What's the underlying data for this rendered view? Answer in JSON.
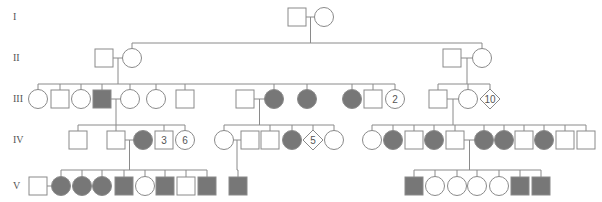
{
  "diagram": {
    "type": "pedigree",
    "colors": {
      "line": "#8a8a8a",
      "affected": "#777777",
      "unaffected": "#ffffff"
    },
    "generations": [
      {
        "label": "I",
        "y": 17
      },
      {
        "label": "II",
        "y": 58
      },
      {
        "label": "III",
        "y": 99
      },
      {
        "label": "IV",
        "y": 140
      },
      {
        "label": "V",
        "y": 186
      }
    ],
    "individuals": [
      {
        "id": "I-1",
        "gen": "I",
        "shape": "square",
        "x": 297,
        "affected": false
      },
      {
        "id": "I-2",
        "gen": "I",
        "shape": "circle",
        "x": 324,
        "affected": false
      },
      {
        "id": "II-1",
        "gen": "II",
        "shape": "square",
        "x": 104,
        "affected": false
      },
      {
        "id": "II-2",
        "gen": "II",
        "shape": "circle",
        "x": 132,
        "affected": false
      },
      {
        "id": "II-3",
        "gen": "II",
        "shape": "square",
        "x": 452,
        "affected": false
      },
      {
        "id": "II-4",
        "gen": "II",
        "shape": "circle",
        "x": 482,
        "affected": false
      },
      {
        "id": "III-1",
        "gen": "III",
        "shape": "circle",
        "x": 38,
        "affected": false
      },
      {
        "id": "III-2",
        "gen": "III",
        "shape": "square",
        "x": 60,
        "affected": false
      },
      {
        "id": "III-3",
        "gen": "III",
        "shape": "circle",
        "x": 81,
        "affected": false
      },
      {
        "id": "III-4",
        "gen": "III",
        "shape": "square",
        "x": 102,
        "affected": true
      },
      {
        "id": "III-5",
        "gen": "III",
        "shape": "circle",
        "x": 130,
        "affected": false
      },
      {
        "id": "III-6",
        "gen": "III",
        "shape": "circle",
        "x": 156,
        "affected": false
      },
      {
        "id": "III-7",
        "gen": "III",
        "shape": "square",
        "x": 185,
        "affected": false
      },
      {
        "id": "III-8",
        "gen": "III",
        "shape": "square",
        "x": 245,
        "affected": false
      },
      {
        "id": "III-9",
        "gen": "III",
        "shape": "circle",
        "x": 274,
        "affected": true
      },
      {
        "id": "III-10",
        "gen": "III",
        "shape": "circle",
        "x": 307,
        "affected": true
      },
      {
        "id": "III-11",
        "gen": "III",
        "shape": "circle",
        "x": 352,
        "affected": true
      },
      {
        "id": "III-12",
        "gen": "III",
        "shape": "square",
        "x": 373,
        "affected": false
      },
      {
        "id": "III-13",
        "gen": "III",
        "shape": "circle",
        "x": 395,
        "affected": false,
        "count": "2"
      },
      {
        "id": "III-14",
        "gen": "III",
        "shape": "square",
        "x": 438,
        "affected": false
      },
      {
        "id": "III-15",
        "gen": "III",
        "shape": "circle",
        "x": 468,
        "affected": false
      },
      {
        "id": "III-16",
        "gen": "III",
        "shape": "diamond",
        "x": 490,
        "affected": false,
        "count": "10"
      },
      {
        "id": "IV-1",
        "gen": "IV",
        "shape": "square",
        "x": 78,
        "affected": false
      },
      {
        "id": "IV-2",
        "gen": "IV",
        "shape": "square",
        "x": 116,
        "affected": false
      },
      {
        "id": "IV-3",
        "gen": "IV",
        "shape": "circle",
        "x": 143,
        "affected": true
      },
      {
        "id": "IV-4",
        "gen": "IV",
        "shape": "square",
        "x": 164,
        "affected": false,
        "count": "3"
      },
      {
        "id": "IV-5",
        "gen": "IV",
        "shape": "circle",
        "x": 185,
        "affected": false,
        "count": "6"
      },
      {
        "id": "IV-6",
        "gen": "IV",
        "shape": "circle",
        "x": 224,
        "affected": false
      },
      {
        "id": "IV-7",
        "gen": "IV",
        "shape": "square",
        "x": 250,
        "affected": false
      },
      {
        "id": "IV-8",
        "gen": "IV",
        "shape": "square",
        "x": 270,
        "affected": false
      },
      {
        "id": "IV-9",
        "gen": "IV",
        "shape": "circle",
        "x": 292,
        "affected": true
      },
      {
        "id": "IV-10",
        "gen": "IV",
        "shape": "diamond",
        "x": 313,
        "affected": false,
        "count": "5"
      },
      {
        "id": "IV-11",
        "gen": "IV",
        "shape": "circle",
        "x": 334,
        "affected": false
      },
      {
        "id": "IV-12",
        "gen": "IV",
        "shape": "circle",
        "x": 372,
        "affected": false
      },
      {
        "id": "IV-13",
        "gen": "IV",
        "shape": "circle",
        "x": 393,
        "affected": true
      },
      {
        "id": "IV-14",
        "gen": "IV",
        "shape": "square",
        "x": 414,
        "affected": false
      },
      {
        "id": "IV-15",
        "gen": "IV",
        "shape": "circle",
        "x": 434,
        "affected": true
      },
      {
        "id": "IV-16",
        "gen": "IV",
        "shape": "square",
        "x": 455,
        "affected": false
      },
      {
        "id": "IV-17",
        "gen": "IV",
        "shape": "circle",
        "x": 484,
        "affected": true
      },
      {
        "id": "IV-18",
        "gen": "IV",
        "shape": "circle",
        "x": 504,
        "affected": true
      },
      {
        "id": "IV-19",
        "gen": "IV",
        "shape": "square",
        "x": 524,
        "affected": false
      },
      {
        "id": "IV-20",
        "gen": "IV",
        "shape": "circle",
        "x": 544,
        "affected": true
      },
      {
        "id": "IV-21",
        "gen": "IV",
        "shape": "square",
        "x": 565,
        "affected": false
      },
      {
        "id": "IV-22",
        "gen": "IV",
        "shape": "square",
        "x": 586,
        "affected": false
      },
      {
        "id": "V-1",
        "gen": "V",
        "shape": "square",
        "x": 38,
        "affected": false
      },
      {
        "id": "V-2",
        "gen": "V",
        "shape": "circle",
        "x": 61,
        "affected": true
      },
      {
        "id": "V-3",
        "gen": "V",
        "shape": "circle",
        "x": 82,
        "affected": true
      },
      {
        "id": "V-4",
        "gen": "V",
        "shape": "circle",
        "x": 102,
        "affected": true
      },
      {
        "id": "V-5",
        "gen": "V",
        "shape": "square",
        "x": 124,
        "affected": true
      },
      {
        "id": "V-6",
        "gen": "V",
        "shape": "circle",
        "x": 145,
        "affected": false
      },
      {
        "id": "V-7",
        "gen": "V",
        "shape": "square",
        "x": 165,
        "affected": true
      },
      {
        "id": "V-8",
        "gen": "V",
        "shape": "square",
        "x": 186,
        "affected": false
      },
      {
        "id": "V-9",
        "gen": "V",
        "shape": "square",
        "x": 207,
        "affected": true
      },
      {
        "id": "V-10",
        "gen": "V",
        "shape": "square",
        "x": 238,
        "affected": true
      },
      {
        "id": "V-11",
        "gen": "V",
        "shape": "square",
        "x": 414,
        "affected": true
      },
      {
        "id": "V-12",
        "gen": "V",
        "shape": "circle",
        "x": 435,
        "affected": false
      },
      {
        "id": "V-13",
        "gen": "V",
        "shape": "circle",
        "x": 457,
        "affected": false
      },
      {
        "id": "V-14",
        "gen": "V",
        "shape": "circle",
        "x": 477,
        "affected": false
      },
      {
        "id": "V-15",
        "gen": "V",
        "shape": "circle",
        "x": 499,
        "affected": false
      },
      {
        "id": "V-16",
        "gen": "V",
        "shape": "square",
        "x": 520,
        "affected": true
      },
      {
        "id": "V-17",
        "gen": "V",
        "shape": "square",
        "x": 541,
        "affected": true
      }
    ],
    "marriages": [
      {
        "a": "I-1",
        "b": "I-2",
        "children": [
          "II-2",
          "II-4"
        ],
        "drop_y": 43
      },
      {
        "a": "II-1",
        "b": "II-2",
        "children": [
          "III-1",
          "III-2",
          "III-3",
          "III-4",
          "III-5",
          "III-6",
          "III-7",
          "III-9",
          "III-10",
          "III-11",
          "III-12",
          "III-13"
        ],
        "drop_y": 84
      },
      {
        "a": "II-3",
        "b": "II-4",
        "children": [
          "III-14",
          "III-15",
          "III-16"
        ],
        "drop_y": 84
      },
      {
        "a": "III-4",
        "b": "III-5",
        "children": [
          "IV-1",
          "IV-2",
          "IV-4",
          "IV-5"
        ],
        "drop_y": 125
      },
      {
        "a": "III-8",
        "b": "III-9",
        "children": [
          "IV-6",
          "IV-8",
          "IV-9",
          "IV-10",
          "IV-11"
        ],
        "drop_y": 125
      },
      {
        "a": "III-14",
        "b": "III-15",
        "children": [
          "IV-12",
          "IV-13",
          "IV-14",
          "IV-15",
          "IV-16",
          "IV-17",
          "IV-18",
          "IV-19",
          "IV-20",
          "IV-21",
          "IV-22"
        ],
        "drop_y": 125
      },
      {
        "a": "IV-2",
        "b": "IV-3",
        "children": [
          "V-2",
          "V-3",
          "V-4",
          "V-5",
          "V-6",
          "V-7",
          "V-8",
          "V-9"
        ],
        "drop_y": 170
      },
      {
        "a": "IV-6",
        "b": "IV-7",
        "children": [
          "V-10"
        ],
        "drop_y": 170
      },
      {
        "a": "IV-16",
        "b": "IV-17",
        "children": [
          "V-11",
          "V-12",
          "V-13",
          "V-14",
          "V-15",
          "V-16",
          "V-17"
        ],
        "drop_y": 170
      },
      {
        "a": "V-1",
        "b": "V-2",
        "children": [],
        "drop_y": 0
      }
    ]
  }
}
